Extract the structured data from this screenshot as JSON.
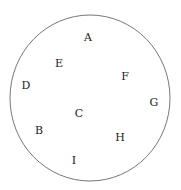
{
  "diagram": {
    "type": "labeled-points-in-circle",
    "circle": {
      "cx": 90,
      "cy": 98,
      "rx": 80,
      "ry": 83,
      "stroke": "#777777"
    },
    "labels": [
      {
        "text": "A",
        "x": 88,
        "y": 41
      },
      {
        "text": "E",
        "x": 59,
        "y": 67
      },
      {
        "text": "F",
        "x": 125,
        "y": 80
      },
      {
        "text": "D",
        "x": 26,
        "y": 89
      },
      {
        "text": "G",
        "x": 154,
        "y": 106
      },
      {
        "text": "C",
        "x": 79,
        "y": 117
      },
      {
        "text": "B",
        "x": 39,
        "y": 134
      },
      {
        "text": "H",
        "x": 120,
        "y": 141
      },
      {
        "text": "I",
        "x": 74,
        "y": 164
      }
    ]
  }
}
